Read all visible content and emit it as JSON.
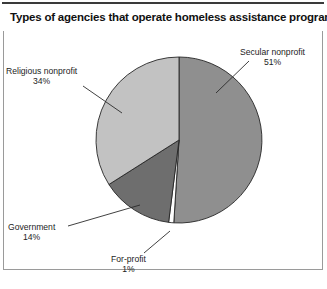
{
  "figure": {
    "title": "Types of agencies that operate homeless assistance programs",
    "source_note_partial": "",
    "frame_color": "#9a9a9a",
    "rule_color": "#3a3a3a",
    "background": "#ffffff"
  },
  "callouts": {
    "secular": {
      "name": "Secular nonprofit",
      "percent": "51%"
    },
    "religious": {
      "name": "Religious nonprofit",
      "percent": "34%"
    },
    "government": {
      "name": "Government",
      "percent": "14%"
    },
    "forprofit": {
      "name": "For-profit",
      "percent": "1%"
    }
  },
  "chart_data": {
    "type": "pie",
    "title": "Types of agencies that operate homeless assistance programs",
    "xlabel": "",
    "ylabel": "",
    "labels": [
      "Secular nonprofit",
      "For-profit",
      "Government",
      "Religious nonprofit"
    ],
    "values": [
      51,
      1,
      14,
      34
    ],
    "value_labels": [
      "51%",
      "1%",
      "14%",
      "34%"
    ],
    "colors": [
      "#8f8f8f",
      "#fdfdfd",
      "#6e6e6e",
      "#c2c2c2"
    ],
    "units": "percent",
    "start_angle_deg": 0,
    "direction": "clockwise",
    "legend": "none",
    "labels_position": "outside-with-leader-lines",
    "grid": false,
    "center_px": {
      "x": 179,
      "y": 140
    },
    "radius_px": 83,
    "slices": [
      {
        "label": "Secular nonprofit",
        "value": 51,
        "value_label": "51%",
        "color": "#8f8f8f",
        "start_deg": 0.0,
        "end_deg": 183.6
      },
      {
        "label": "For-profit",
        "value": 1,
        "value_label": "1%",
        "color": "#fdfdfd",
        "start_deg": 183.6,
        "end_deg": 187.2
      },
      {
        "label": "Government",
        "value": 14,
        "value_label": "14%",
        "color": "#6e6e6e",
        "start_deg": 187.2,
        "end_deg": 237.6
      },
      {
        "label": "Religious nonprofit",
        "value": 34,
        "value_label": "34%",
        "color": "#c2c2c2",
        "start_deg": 237.6,
        "end_deg": 360.0
      }
    ]
  }
}
